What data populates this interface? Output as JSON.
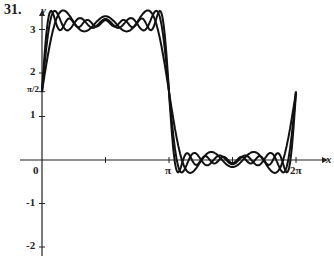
{
  "problem_number": "31.",
  "chart_data": {
    "type": "line",
    "title": "",
    "xlabel": "x",
    "ylabel": "y",
    "x_ticks": [
      "0",
      "π",
      "2π"
    ],
    "y_ticks": [
      "-2",
      "-1",
      "1",
      "π/2",
      "2",
      "3"
    ],
    "xlim": [
      0,
      6.5
    ],
    "ylim": [
      -2.3,
      3.5
    ],
    "series": [
      {
        "name": "S3",
        "terms": 3
      },
      {
        "name": "S5",
        "terms": 5
      },
      {
        "name": "S7",
        "terms": 7
      }
    ]
  }
}
